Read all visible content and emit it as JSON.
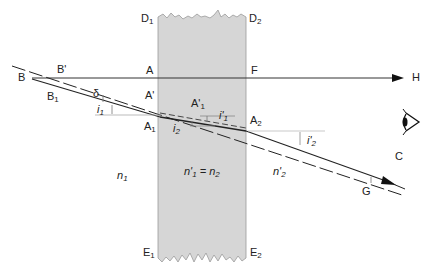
{
  "diagram": {
    "type": "optics-refraction-through-parallel-slab",
    "colors": {
      "slab": "#d6d6d6",
      "line": "#222222",
      "guide": "#999999",
      "background": "#ffffff"
    },
    "points": {
      "B": "B",
      "B_prime": "B'",
      "B1": "B",
      "B1_sub": "1",
      "A": "A",
      "A_prime": "A'",
      "A1": "A",
      "A1_sub": "1",
      "A_prime1": "A'",
      "A_prime1_sub": "1",
      "A2": "A",
      "A2_sub": "2",
      "F": "F",
      "H": "H",
      "C": "C",
      "G": "G",
      "D1": "D",
      "D1_sub": "1",
      "D2": "D",
      "D2_sub": "2",
      "E1": "E",
      "E1_sub": "1",
      "E2": "E",
      "E2_sub": "2"
    },
    "angles": {
      "delta": "δ",
      "i1": "i",
      "i1_sub": "1",
      "i2": "i",
      "i2_sub": "2",
      "i_prime1": "i'",
      "i_prime1_sub": "1",
      "i_prime2": "i'",
      "i_prime2_sub": "2"
    },
    "media": {
      "n1": "n",
      "n1_sub": "1",
      "slab": "n'",
      "slab_sub1": "1",
      "slab_eq": " = n",
      "slab_sub2": "2",
      "n_prime2": "n'",
      "n_prime2_sub": "2"
    },
    "observer": "eye-icon"
  }
}
